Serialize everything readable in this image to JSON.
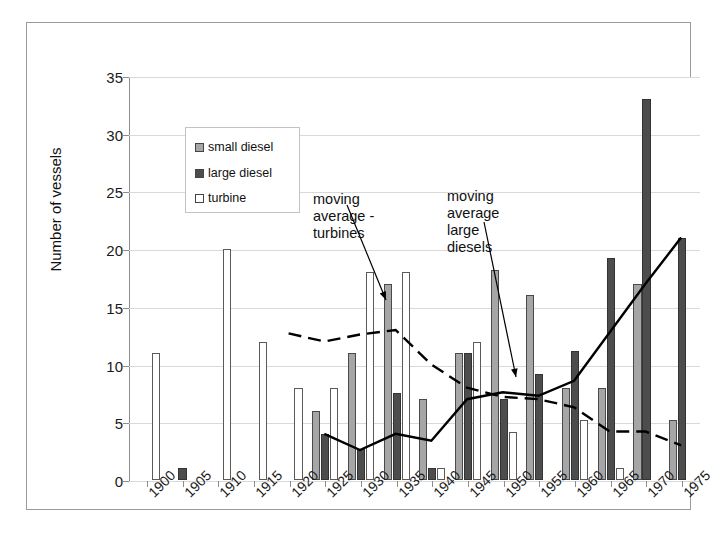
{
  "chart_data": {
    "type": "bar",
    "title": "",
    "xlabel": "",
    "ylabel": "Number of vessels",
    "ylim": [
      0,
      35
    ],
    "ytick_step": 5,
    "grid": true,
    "legend_position": "inside-top-left",
    "categories": [
      "1900",
      "1905",
      "1910",
      "1915",
      "1920",
      "1925",
      "1930",
      "1935",
      "1940",
      "1945",
      "1950",
      "1955",
      "1960",
      "1965",
      "1970",
      "1975"
    ],
    "series": [
      {
        "name": "small diesel",
        "color": "#a6a6a6",
        "values": [
          0,
          0,
          0,
          0,
          0,
          6,
          11,
          17,
          7,
          11,
          18.2,
          16,
          8,
          8,
          17,
          5.2
        ]
      },
      {
        "name": "large diesel",
        "color": "#4d4d4d",
        "values": [
          0,
          1,
          0,
          0,
          0,
          4,
          2.7,
          7.5,
          1,
          11,
          7,
          9.2,
          11.2,
          19.2,
          33,
          21
        ]
      },
      {
        "name": "turbine",
        "color": "#ffffff",
        "values": [
          11,
          0,
          20,
          12,
          8,
          8,
          18,
          18,
          1,
          12,
          4.2,
          0,
          5.2,
          1,
          0,
          0
        ]
      }
    ],
    "lines": [
      {
        "name": "moving average - turbines",
        "style": "dashed",
        "color": "#000000",
        "x": [
          "1920",
          "1925",
          "1930",
          "1935",
          "1940",
          "1945",
          "1950",
          "1955",
          "1960",
          "1965",
          "1970",
          "1975"
        ],
        "values": [
          12.7,
          12.0,
          12.6,
          13.0,
          10.0,
          8.0,
          7.2,
          7.0,
          6.3,
          4.2,
          4.2,
          3.0
        ]
      },
      {
        "name": "moving average large diesels",
        "style": "solid",
        "color": "#000000",
        "x": [
          "1925",
          "1930",
          "1935",
          "1940",
          "1945",
          "1950",
          "1955",
          "1960",
          "1965",
          "1970",
          "1975"
        ],
        "values": [
          4.0,
          2.6,
          4.0,
          3.4,
          7.0,
          7.6,
          7.3,
          8.6,
          12.8,
          17.0,
          21.0
        ]
      }
    ],
    "annotations": [
      {
        "text": "moving\naverage -\nturbines",
        "points_to": "moving average - turbines line near 1940"
      },
      {
        "text": "moving\naverage\nlarge\ndiesels",
        "points_to": "moving average large diesels line near 1960"
      }
    ]
  },
  "legend": {
    "items": [
      {
        "label": "small diesel"
      },
      {
        "label": "large diesel"
      },
      {
        "label": "turbine"
      }
    ]
  },
  "axis": {
    "y_title": "Number of vessels",
    "y_ticks": [
      "0",
      "5",
      "10",
      "15",
      "20",
      "25",
      "30",
      "35"
    ]
  },
  "annotations": {
    "turbines": "moving\naverage -\nturbines",
    "large_diesels": "moving\naverage\nlarge\ndiesels"
  }
}
